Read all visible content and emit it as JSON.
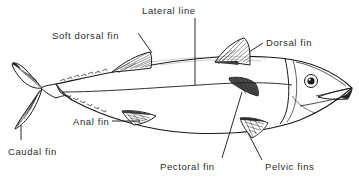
{
  "diagram": {
    "background_color": "#ffffff",
    "line_color": "#1a1a1a",
    "text_color": "#2b2b2b",
    "labels": [
      {
        "id": "lateral-line",
        "text": "Lateral line",
        "x": 142,
        "y": 6,
        "leader": "vertical-down"
      },
      {
        "id": "soft-dorsal-fin",
        "text": "Soft dorsal fin",
        "x": 52,
        "y": 31,
        "leader": "diagonal-down-right"
      },
      {
        "id": "dorsal-fin",
        "text": "Dorsal fin",
        "x": 266,
        "y": 38,
        "leader": "diagonal-down-left"
      },
      {
        "id": "anal-fin",
        "text": "Anal fin",
        "x": 73,
        "y": 117,
        "leader": "horizontal-right"
      },
      {
        "id": "caudal-fin",
        "text": "Caudal fin",
        "x": 8,
        "y": 147,
        "leader": "vertical-up"
      },
      {
        "id": "pectoral-fin",
        "text": "Pectoral fin",
        "x": 160,
        "y": 162,
        "leader": "diagonal-up-right"
      },
      {
        "id": "pelvic-fins",
        "text": "Pelvic fins",
        "x": 265,
        "y": 162,
        "leader": "diagonal-up-left"
      }
    ],
    "parts": [
      {
        "id": "body",
        "name": "fish body"
      },
      {
        "id": "head",
        "name": "head"
      },
      {
        "id": "eye",
        "name": "eye"
      },
      {
        "id": "mouth",
        "name": "mouth"
      },
      {
        "id": "gill-cover",
        "name": "gill cover"
      },
      {
        "id": "lateral-line",
        "name": "lateral line"
      },
      {
        "id": "dorsal-fin",
        "name": "dorsal fin"
      },
      {
        "id": "soft-dorsal-fin",
        "name": "soft dorsal fin"
      },
      {
        "id": "caudal-fin",
        "name": "caudal fin"
      },
      {
        "id": "anal-fin",
        "name": "anal fin"
      },
      {
        "id": "pectoral-fin",
        "name": "pectoral fin"
      },
      {
        "id": "pelvic-fins",
        "name": "pelvic fins"
      },
      {
        "id": "finlets",
        "name": "finlets"
      }
    ]
  }
}
